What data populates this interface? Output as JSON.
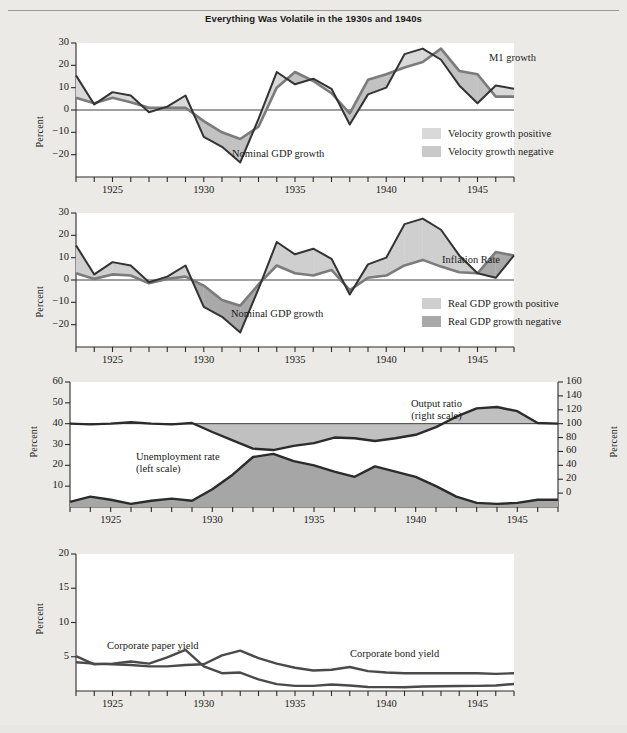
{
  "figure": {
    "title": "Everything Was Volatile in the 1930s and 1940s",
    "colors": {
      "line_dark": "#3a3a3a",
      "line_mid": "#6f6f6f",
      "fill_light": "#d8d8d8",
      "fill_dark": "#a8a8a8",
      "plot_bg": "#ffffff",
      "page_bg": "#eceae6"
    }
  },
  "chart_data": [
    {
      "type": "line",
      "panel": 1,
      "title": "",
      "xlabel": "",
      "ylabel": "Percent",
      "ylim": [
        -30,
        30
      ],
      "yticks": [
        30,
        20,
        10,
        0,
        -10,
        -20
      ],
      "xlim": [
        1923,
        1947
      ],
      "xticks": [
        1925,
        1930,
        1935,
        1940,
        1945
      ],
      "x": [
        1923,
        1924,
        1925,
        1926,
        1927,
        1928,
        1929,
        1930,
        1931,
        1932,
        1933,
        1934,
        1935,
        1936,
        1937,
        1938,
        1939,
        1940,
        1941,
        1942,
        1943,
        1944,
        1945,
        1946,
        1947
      ],
      "series": [
        {
          "name": "Nominal GDP growth",
          "values": [
            15.5,
            2.5,
            8.0,
            6.5,
            -1.0,
            1.5,
            6.5,
            -12.0,
            -16.5,
            -23.5,
            -4.0,
            17.0,
            11.5,
            14.0,
            9.5,
            -6.5,
            7.0,
            10.0,
            25.0,
            27.5,
            22.5,
            11.0,
            3.0,
            11.0,
            9.5
          ]
        },
        {
          "name": "M1 growth",
          "values": [
            5.5,
            3.0,
            5.5,
            3.5,
            1.0,
            1.0,
            1.0,
            -5.0,
            -10.0,
            -13.0,
            -7.5,
            10.0,
            17.0,
            13.0,
            7.5,
            -1.5,
            13.5,
            16.0,
            19.0,
            21.5,
            27.5,
            17.5,
            16.0,
            6.0,
            6.0
          ]
        }
      ],
      "annotations": [
        {
          "text": "M1 growth",
          "x": 1943.3,
          "y": 24
        },
        {
          "text": "Nominal GDP growth",
          "x": 1934.5,
          "y": -18
        }
      ],
      "legend": [
        {
          "label": "Velocity growth positive",
          "color": "#d9d9d9"
        },
        {
          "label": "Velocity growth negative",
          "color": "#c9c9c9"
        }
      ]
    },
    {
      "type": "line",
      "panel": 2,
      "title": "",
      "xlabel": "",
      "ylabel": "Percent",
      "ylim": [
        -30,
        30
      ],
      "yticks": [
        30,
        20,
        10,
        0,
        -10,
        -20
      ],
      "xlim": [
        1923,
        1947
      ],
      "xticks": [
        1925,
        1930,
        1935,
        1940,
        1945
      ],
      "x": [
        1923,
        1924,
        1925,
        1926,
        1927,
        1928,
        1929,
        1930,
        1931,
        1932,
        1933,
        1934,
        1935,
        1936,
        1937,
        1938,
        1939,
        1940,
        1941,
        1942,
        1943,
        1944,
        1945,
        1946,
        1947
      ],
      "series": [
        {
          "name": "Nominal GDP growth",
          "values": [
            15.5,
            2.5,
            8.0,
            6.5,
            -1.0,
            1.5,
            6.5,
            -12.0,
            -16.5,
            -23.5,
            -4.0,
            17.0,
            11.5,
            14.0,
            9.5,
            -6.5,
            7.0,
            10.0,
            25.0,
            27.5,
            22.5,
            11.0,
            3.0,
            1.0,
            11.0
          ]
        },
        {
          "name": "Inflation Rate",
          "values": [
            3.0,
            0.5,
            2.5,
            2.0,
            -1.5,
            0.5,
            1.5,
            -2.5,
            -9.0,
            -11.5,
            -2.0,
            6.5,
            3.0,
            2.0,
            4.5,
            -4.5,
            1.0,
            2.0,
            6.5,
            9.0,
            6.0,
            3.5,
            3.0,
            12.5,
            11.0
          ]
        }
      ],
      "annotations": [
        {
          "text": "Inflation Rate",
          "x": 1944.2,
          "y": 18
        },
        {
          "text": "Nominal GDP growth",
          "x": 1934.0,
          "y": -13
        }
      ],
      "legend": [
        {
          "label": "Real GDP growth positive",
          "color": "#cfcfcf"
        },
        {
          "label": "Real GDP growth negative",
          "color": "#a9a9a9"
        }
      ]
    },
    {
      "type": "area",
      "panel": 3,
      "title": "",
      "xlabel": "",
      "ylabel": "Percent",
      "ylabel_right": "Percent",
      "ylim": [
        0,
        60
      ],
      "yticks": [
        60,
        50,
        40,
        30,
        20,
        10
      ],
      "ylim_right": [
        -20,
        160
      ],
      "yticks_right": [
        160,
        140,
        120,
        100,
        80,
        60,
        40,
        20,
        0
      ],
      "xlim": [
        1923,
        1947
      ],
      "xticks": [
        1925,
        1930,
        1935,
        1940,
        1945
      ],
      "x": [
        1923,
        1924,
        1925,
        1926,
        1927,
        1928,
        1929,
        1930,
        1931,
        1932,
        1933,
        1934,
        1935,
        1936,
        1937,
        1938,
        1939,
        1940,
        1941,
        1942,
        1943,
        1944,
        1945,
        1946,
        1947
      ],
      "series": [
        {
          "name": "Unemployment rate (left scale)",
          "values": [
            2.5,
            5.0,
            3.5,
            1.5,
            3.0,
            4.0,
            3.0,
            8.5,
            15.5,
            24.0,
            25.5,
            22.0,
            20.0,
            17.0,
            14.5,
            19.5,
            17.0,
            14.5,
            10.0,
            5.0,
            2.0,
            1.5,
            2.0,
            3.5,
            3.5
          ]
        },
        {
          "name": "Output ratio (right scale)",
          "values": [
            100,
            99,
            100,
            102,
            100,
            99,
            101,
            88,
            76,
            64,
            62,
            68,
            72,
            80,
            79,
            75,
            79,
            84,
            95,
            110,
            122,
            124,
            118,
            101,
            100
          ]
        }
      ],
      "annotations": [
        {
          "text": "Output ratio",
          "sub": "(right scale)",
          "x": 1940.5,
          "y_right": 133
        },
        {
          "text": "Unemployment rate",
          "sub": "(left scale)",
          "x": 1929.0,
          "y": 21
        }
      ],
      "legend": []
    },
    {
      "type": "line",
      "panel": 4,
      "title": "",
      "xlabel": "",
      "ylabel": "Percent",
      "ylim": [
        0,
        20
      ],
      "yticks": [
        20,
        15,
        10,
        5
      ],
      "xlim": [
        1923,
        1947
      ],
      "xticks": [
        1925,
        1930,
        1935,
        1940,
        1945
      ],
      "x": [
        1923,
        1924,
        1925,
        1926,
        1927,
        1928,
        1929,
        1930,
        1931,
        1932,
        1933,
        1934,
        1935,
        1936,
        1937,
        1938,
        1939,
        1940,
        1941,
        1942,
        1943,
        1944,
        1945,
        1946,
        1947
      ],
      "series": [
        {
          "name": "Corporate paper yield",
          "values": [
            5.1,
            3.9,
            4.0,
            4.3,
            4.0,
            4.9,
            6.0,
            3.6,
            2.6,
            2.7,
            1.7,
            1.0,
            0.75,
            0.75,
            0.94,
            0.81,
            0.59,
            0.56,
            0.54,
            0.66,
            0.69,
            0.73,
            0.75,
            0.81,
            1.03
          ]
        },
        {
          "name": "Corporate bond yield",
          "values": [
            4.2,
            4.0,
            3.9,
            3.8,
            3.6,
            3.6,
            3.8,
            3.9,
            5.2,
            5.9,
            4.8,
            4.0,
            3.4,
            3.0,
            3.1,
            3.5,
            2.9,
            2.7,
            2.6,
            2.6,
            2.6,
            2.6,
            2.6,
            2.5,
            2.6
          ]
        }
      ],
      "annotations": [
        {
          "text": "Corporate paper yield",
          "x": 1925.1,
          "y": 7.5
        },
        {
          "text": "Corporate bond yield",
          "x": 1936.1,
          "y": 6.3
        }
      ],
      "legend": []
    }
  ]
}
